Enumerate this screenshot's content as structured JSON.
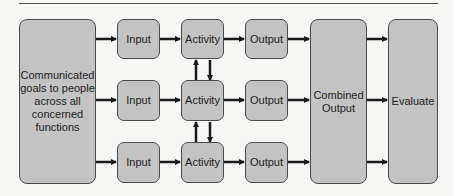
{
  "diagram": {
    "source": {
      "label": "Communicated goals to people across all concerned functions"
    },
    "rows": [
      {
        "input": "Input",
        "activity": "Activity",
        "output": "Output"
      },
      {
        "input": "Input",
        "activity": "Activity",
        "output": "Output"
      },
      {
        "input": "Input",
        "activity": "Activity",
        "output": "Output"
      }
    ],
    "combined": {
      "label": "Combined Output"
    },
    "evaluate": {
      "label": "Evaluate"
    },
    "colors": {
      "box_fill": "#c3c3c3",
      "box_stroke": "#4a4a4a",
      "arrow": "#1a1a1a",
      "background": "#f6f6f5"
    }
  }
}
